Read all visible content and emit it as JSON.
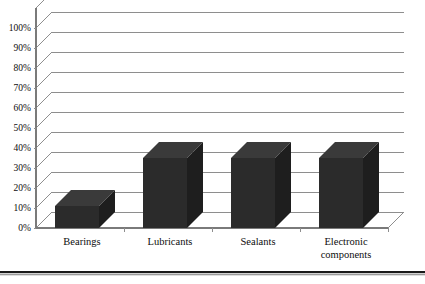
{
  "chart_data": {
    "type": "bar",
    "title": "",
    "subtitle": "",
    "xlabel": "",
    "ylabel": "",
    "categories": [
      "Bearings",
      "Lubricants",
      "Sealants",
      "Electronic components"
    ],
    "category_lines": [
      [
        "Bearings"
      ],
      [
        "Lubricants"
      ],
      [
        "Sealants"
      ],
      [
        "Electronic",
        "components"
      ]
    ],
    "values": [
      11,
      35,
      35,
      35
    ],
    "value_labels": [
      "11%",
      "35%",
      "35%",
      "35%"
    ],
    "ylim": [
      0,
      100
    ],
    "ytick_step": 10,
    "ytick_labels": [
      "0%",
      "10%",
      "20%",
      "30%",
      "40%",
      "50%",
      "60%",
      "70%",
      "80%",
      "90%",
      "100%"
    ],
    "ytick_values": [
      0,
      10,
      20,
      30,
      40,
      50,
      60,
      70,
      80,
      90,
      100
    ],
    "grid": true,
    "grid_axis": "y",
    "legend": false,
    "legend_position": "none",
    "style": "3d-column",
    "bar_face_color": "#2b2b2b",
    "bar_side_color": "#1e1e1e",
    "bar_top_color": "#3a3a3a",
    "gridline_color": "#8e8e8e",
    "axis_color": "#7a7a7a",
    "text_color": "#0d0d0d",
    "background_color": "#ffffff",
    "annotations": []
  },
  "figure": {
    "name": "3d-column-chart",
    "bottom_rule": true
  }
}
